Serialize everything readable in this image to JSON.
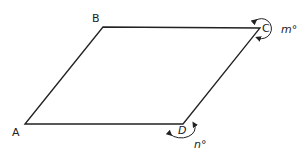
{
  "figure": {
    "type": "parallelogram",
    "vertices": [
      {
        "name": "A",
        "x": 25,
        "y": 124
      },
      {
        "name": "B",
        "x": 103,
        "y": 27
      },
      {
        "name": "C",
        "x": 260,
        "y": 28
      },
      {
        "name": "D",
        "x": 183,
        "y": 124
      }
    ],
    "labels": {
      "A": "A",
      "B": "B",
      "C": "C",
      "D": "D",
      "angle_C": "m°",
      "angle_D": "n°"
    },
    "line_color": "#222222"
  }
}
